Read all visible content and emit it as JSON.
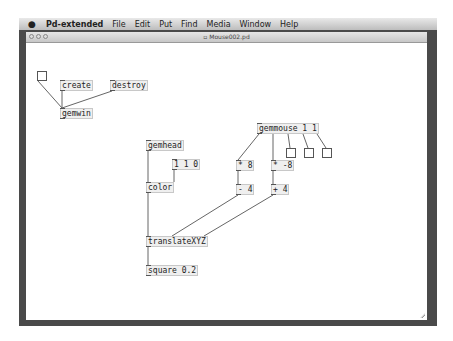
{
  "menubar": {
    "apple_icon": "",
    "app_name": "Pd-extended",
    "items": [
      "File",
      "Edit",
      "Put",
      "Find",
      "Media",
      "Window",
      "Help"
    ]
  },
  "window": {
    "title": "Mouse002.pd"
  },
  "patch": {
    "objects": {
      "create": "create",
      "destroy": "destroy",
      "gemwin": "gemwin",
      "gemhead": "gemhead",
      "msg_110": "1 1 0",
      "color": "color",
      "translate": "translateXYZ",
      "square": "square 0.2",
      "gemmouse": "gemmouse 1 1",
      "mul8": "* 8",
      "mulneg8": "* -8",
      "sub4": "- 4",
      "add4": "+ 4"
    }
  }
}
